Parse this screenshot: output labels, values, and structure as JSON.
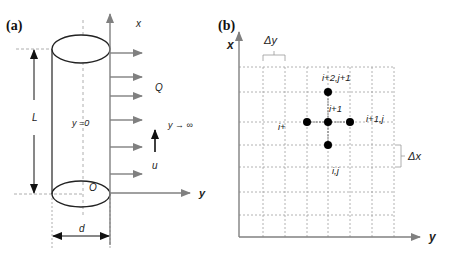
{
  "panel_a": {
    "tag": "(a)",
    "labels": {
      "x_axis": "x",
      "y_axis": "y",
      "heat_flux": "Q",
      "far_field": "y → ∞",
      "velocity": "u",
      "surface": "y =0",
      "origin": "O",
      "length": "L",
      "diameter": "d"
    },
    "flux_arrows_y": [
      53,
      77,
      96,
      120,
      147,
      174
    ]
  },
  "panel_b": {
    "tag": "(b)",
    "labels": {
      "x_axis": "x",
      "y_axis": "y",
      "delta_y": "Δy",
      "delta_x": "Δx",
      "node_top": "i+2,j+1",
      "node_center": "i+1",
      "node_left": "i+",
      "node_right": "i+1,j",
      "node_bottom": "i,j"
    },
    "grid_x": [
      263,
      285,
      307,
      328,
      350,
      372,
      394
    ],
    "grid_y": [
      67,
      92,
      122,
      145,
      167,
      192,
      215
    ],
    "nodes": [
      {
        "x": 328,
        "y": 92
      },
      {
        "x": 307,
        "y": 122
      },
      {
        "x": 328,
        "y": 122
      },
      {
        "x": 350,
        "y": 122
      },
      {
        "x": 328,
        "y": 145
      }
    ]
  },
  "colors": {
    "axis_gray": "#808080",
    "line_dark": "#222222",
    "grid_dash": "#a0a0a0"
  }
}
